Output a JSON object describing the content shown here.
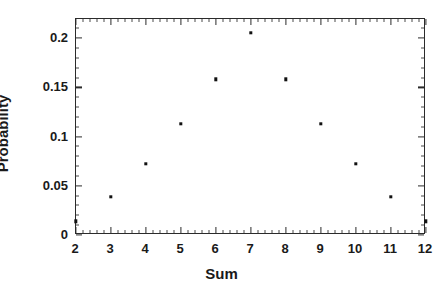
{
  "chart_data": {
    "type": "scatter",
    "title": "",
    "xlabel": "Sum",
    "ylabel": "Probability",
    "x": [
      2,
      3,
      4,
      5,
      6,
      7,
      8,
      9,
      10,
      11,
      12
    ],
    "values": [
      0.0139,
      0.0389,
      0.0722,
      0.1128,
      0.1583,
      0.2056,
      0.1583,
      0.1128,
      0.0722,
      0.0389,
      0.0139
    ],
    "categories": [
      "2",
      "3",
      "4",
      "5",
      "6",
      "7",
      "8",
      "9",
      "10",
      "11",
      "12"
    ],
    "series": [
      {
        "name": "Probability",
        "values": [
          0.0139,
          0.0389,
          0.0722,
          0.1128,
          0.1583,
          0.2056,
          0.1583,
          0.1128,
          0.0722,
          0.0389,
          0.0139
        ]
      }
    ],
    "xlim": [
      2,
      12
    ],
    "ylim": [
      0,
      0.2195
    ],
    "grid": false,
    "legend": false,
    "legend_position": "none",
    "marker": "square",
    "marker_color": "#111111",
    "frame_color": "#2b2b2b",
    "background_color": "#ffffff",
    "xticks": [
      2,
      3,
      4,
      5,
      6,
      7,
      8,
      9,
      10,
      11,
      12
    ],
    "xticklabels": [
      "2",
      "3",
      "4",
      "5",
      "6",
      "7",
      "8",
      "9",
      "10",
      "11",
      "12"
    ],
    "xminorticks": [
      2.2,
      2.4,
      2.6,
      2.8,
      3.2,
      3.4,
      3.6,
      3.8,
      4.2,
      4.4,
      4.6,
      4.8,
      5.2,
      5.4,
      5.6,
      5.8,
      6.2,
      6.4,
      6.6,
      6.8,
      7.2,
      7.4,
      7.6,
      7.8,
      8.2,
      8.4,
      8.6,
      8.8,
      9.2,
      9.4,
      9.6,
      9.8,
      10.2,
      10.4,
      10.6,
      10.8,
      11.2,
      11.4,
      11.6,
      11.8
    ],
    "yticks": [
      0,
      0.05,
      0.1,
      0.15,
      0.2
    ],
    "yticklabels": [
      "0",
      "0.05",
      "0.1",
      "0.15",
      "0.2"
    ],
    "yminorticks": [
      0.01,
      0.02,
      0.03,
      0.04,
      0.06,
      0.07,
      0.08,
      0.09,
      0.11,
      0.12,
      0.13,
      0.14,
      0.16,
      0.17,
      0.18,
      0.19,
      0.21
    ]
  }
}
